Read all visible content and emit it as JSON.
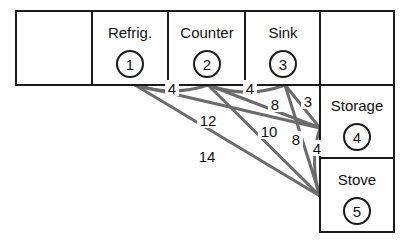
{
  "diagram": {
    "type": "kitchen-layout-distance-diagram",
    "colors": {
      "cell_border": "#1a1a1a",
      "edge_line": "#6b6b6b",
      "text": "#111111",
      "background": "#ffffff"
    },
    "cells": [
      {
        "id": "cell-empty-left",
        "label": "",
        "number": "",
        "x": 16,
        "y": 11,
        "w": 76,
        "h": 74
      },
      {
        "id": "cell-refrigerator",
        "label": "Refrig.",
        "number": "1",
        "x": 92,
        "y": 11,
        "w": 76,
        "h": 74
      },
      {
        "id": "cell-counter",
        "label": "Counter",
        "number": "2",
        "x": 168,
        "y": 11,
        "w": 77,
        "h": 74
      },
      {
        "id": "cell-sink",
        "label": "Sink",
        "number": "3",
        "x": 245,
        "y": 11,
        "w": 75,
        "h": 74
      },
      {
        "id": "cell-empty-right",
        "label": "",
        "number": "",
        "x": 320,
        "y": 11,
        "w": 74,
        "h": 74
      },
      {
        "id": "cell-storage",
        "label": "Storage",
        "number": "4",
        "x": 320,
        "y": 85,
        "w": 74,
        "h": 73
      },
      {
        "id": "cell-stove",
        "label": "Stove",
        "number": "5",
        "x": 320,
        "y": 158,
        "w": 74,
        "h": 74
      }
    ],
    "nodes": [
      {
        "id": "node-1",
        "name": "Refrig.",
        "number": "1"
      },
      {
        "id": "node-2",
        "name": "Counter",
        "number": "2"
      },
      {
        "id": "node-3",
        "name": "Sink",
        "number": "3"
      },
      {
        "id": "node-4",
        "name": "Storage",
        "number": "4"
      },
      {
        "id": "node-5",
        "name": "Stove",
        "number": "5"
      }
    ],
    "edges": [
      {
        "id": "edge-1-2",
        "from": "1",
        "to": "2",
        "weight": "4"
      },
      {
        "id": "edge-2-3",
        "from": "2",
        "to": "3",
        "weight": "4"
      },
      {
        "id": "edge-2-4",
        "from": "2",
        "to": "4",
        "weight": "8"
      },
      {
        "id": "edge-3-4",
        "from": "3",
        "to": "4",
        "weight": "3"
      },
      {
        "id": "edge-1-4",
        "from": "1",
        "to": "4",
        "weight": "12"
      },
      {
        "id": "edge-2-5",
        "from": "2",
        "to": "5",
        "weight": "10"
      },
      {
        "id": "edge-3-5",
        "from": "3",
        "to": "5",
        "weight": "8"
      },
      {
        "id": "edge-4-5",
        "from": "4",
        "to": "5",
        "weight": "4"
      },
      {
        "id": "edge-1-5",
        "from": "1",
        "to": "5",
        "weight": "14"
      }
    ],
    "weight_labels": [
      {
        "id": "weight-label-4-a",
        "text": "4",
        "x": 172,
        "y": 88
      },
      {
        "id": "weight-label-4-b",
        "text": "4",
        "x": 250,
        "y": 88
      },
      {
        "id": "weight-label-8-a",
        "text": "8",
        "x": 275,
        "y": 104
      },
      {
        "id": "weight-label-3",
        "text": "3",
        "x": 308,
        "y": 101
      },
      {
        "id": "weight-label-12",
        "text": "12",
        "x": 208,
        "y": 120
      },
      {
        "id": "weight-label-10",
        "text": "10",
        "x": 269,
        "y": 131
      },
      {
        "id": "weight-label-8-b",
        "text": "8",
        "x": 296,
        "y": 139
      },
      {
        "id": "weight-label-4-c",
        "text": "4",
        "x": 317,
        "y": 148
      },
      {
        "id": "weight-label-14",
        "text": "14",
        "x": 207,
        "y": 156
      }
    ]
  }
}
